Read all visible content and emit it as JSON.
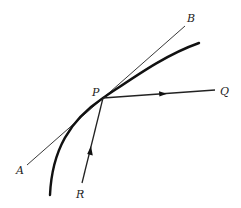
{
  "diagram": {
    "labels": {
      "A": "A",
      "B": "B",
      "P": "P",
      "Q": "Q",
      "R": "R"
    },
    "colors": {
      "stroke": "#222222",
      "background": "#ffffff"
    },
    "elements": {
      "curve": "thick curve passing through point P",
      "tangent": "straight tangent line AB touching curve at P",
      "ray_PQ": "ray from P toward Q with arrow pointing toward Q",
      "ray_RP": "ray from R toward P with arrow pointing toward P"
    }
  }
}
